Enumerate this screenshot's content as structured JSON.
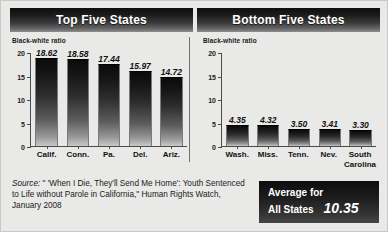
{
  "chart_data": {
    "type": "bar",
    "title": "",
    "ylabel": "Black-white ratio",
    "xlabel": "",
    "ylim": [
      0,
      20
    ],
    "yticks": [
      20,
      15,
      10,
      5,
      0
    ],
    "grid": false,
    "legend": "none",
    "panels": [
      {
        "title": "Top Five States",
        "axis_label": "Black-white ratio",
        "categories": [
          "Calif.",
          "Conn.",
          "Pa.",
          "Del.",
          "Ariz."
        ],
        "values": [
          18.62,
          18.58,
          17.44,
          15.97,
          14.72
        ],
        "value_labels": [
          "18.62",
          "18.58",
          "17.44",
          "15.97",
          "14.72"
        ]
      },
      {
        "title": "Bottom Five States",
        "axis_label": "Black-white ratio",
        "categories": [
          "Wash.",
          "Miss.",
          "Tenn.",
          "Nev.",
          "South Carolina"
        ],
        "values": [
          4.35,
          4.32,
          3.5,
          3.41,
          3.3
        ],
        "value_labels": [
          "4.35",
          "4.32",
          "3.50",
          "3.41",
          "3.30"
        ]
      }
    ],
    "annotations": [
      {
        "label": "Average for All States",
        "value": 10.35,
        "value_label": "10.35"
      }
    ]
  },
  "banners": {
    "left": "Top Five States",
    "right": "Bottom Five States"
  },
  "axis": {
    "label": "Black-white ratio",
    "ticks": [
      "20",
      "15",
      "10",
      "5",
      "0"
    ]
  },
  "source": {
    "label": "Source:",
    "text": " \" 'When I Die, They'll Send Me Home': Youth Sentenced to Life without Parole in California,\" Human Rights Watch, January 2008"
  },
  "average_box": {
    "line1": "Average for",
    "line2": "All States",
    "value": "10.35"
  }
}
